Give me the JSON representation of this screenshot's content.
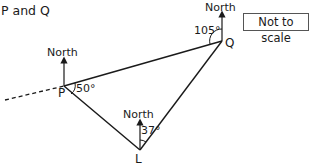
{
  "title": "P and Q",
  "note": "Not to scale",
  "diagram": {
    "points": [
      {
        "name": "P",
        "label": "P"
      },
      {
        "name": "Q",
        "label": "Q"
      },
      {
        "name": "L",
        "label": "L"
      }
    ],
    "north_labels": {
      "P": "North",
      "Q": "North",
      "L": "North"
    },
    "angles": {
      "P": "50°",
      "Q": "105°",
      "L": "37°"
    }
  }
}
